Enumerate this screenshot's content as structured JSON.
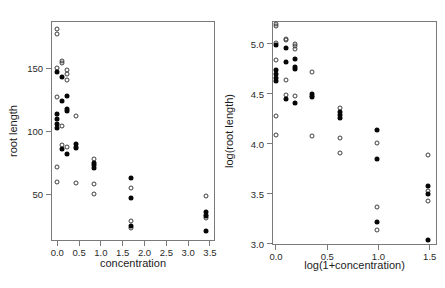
{
  "figure": {
    "background": "#ffffff",
    "axis_color": "#7a7a7a",
    "open_marker_color": "#3d3d3d",
    "filled_marker_color": "#060606"
  },
  "chart_data": [
    {
      "type": "scatter",
      "title": "",
      "xlabel": "concentration",
      "ylabel": "root length",
      "xlim": [
        -0.144,
        3.615
      ],
      "ylim": [
        13.05,
        187.7
      ],
      "xticks": [
        0.0,
        0.5,
        1.0,
        1.5,
        2.0,
        2.5,
        3.0,
        3.5
      ],
      "xtick_labels": [
        "0.0",
        "0.5",
        "1.0",
        "1.5",
        "2.0",
        "2.5",
        "3.0",
        "3.5"
      ],
      "yticks": [
        50,
        100,
        150
      ],
      "ytick_labels": [
        "50",
        "100",
        "150"
      ],
      "grid": false,
      "legend": "none",
      "series": [
        {
          "name": "open-circles",
          "marker": "open",
          "points": [
            [
              0,
              181
            ],
            [
              0,
              177
            ],
            [
              0,
              150
            ],
            [
              0,
              127
            ],
            [
              0,
              72
            ],
            [
              0,
              60
            ],
            [
              0.106,
              156
            ],
            [
              0.106,
              154
            ],
            [
              0.106,
              104
            ],
            [
              0.106,
              89
            ],
            [
              0.213,
              149
            ],
            [
              0.213,
              146
            ],
            [
              0.213,
              141
            ],
            [
              0.213,
              88
            ],
            [
              0.425,
              112
            ],
            [
              0.425,
              88
            ],
            [
              0.425,
              59
            ],
            [
              0.85,
              78
            ],
            [
              0.85,
              58
            ],
            [
              0.85,
              50
            ],
            [
              1.7,
              55
            ],
            [
              1.7,
              29
            ],
            [
              1.7,
              23
            ],
            [
              3.4,
              49
            ],
            [
              3.4,
              34
            ],
            [
              3.4,
              31
            ]
          ]
        },
        {
          "name": "filled-circles",
          "marker": "filled",
          "points": [
            [
              0,
              147
            ],
            [
              0,
              114
            ],
            [
              0,
              110
            ],
            [
              0,
              106
            ],
            [
              0,
              103
            ],
            [
              0.106,
              143
            ],
            [
              0.106,
              124
            ],
            [
              0.106,
              86
            ],
            [
              0.213,
              128
            ],
            [
              0.213,
              118
            ],
            [
              0.213,
              116
            ],
            [
              0.213,
              82
            ],
            [
              0.425,
              90
            ],
            [
              0.425,
              87
            ],
            [
              0.85,
              75
            ],
            [
              0.85,
              73
            ],
            [
              0.85,
              71
            ],
            [
              1.7,
              63
            ],
            [
              1.7,
              47
            ],
            [
              1.7,
              25
            ],
            [
              3.4,
              36
            ],
            [
              3.4,
              33
            ],
            [
              3.4,
              21
            ]
          ]
        }
      ]
    },
    {
      "type": "scatter",
      "title": "",
      "xlabel": "log(1+concentration)",
      "ylabel": "log(root length)",
      "xlim": [
        -0.039,
        1.571
      ],
      "ylim": [
        2.985,
        5.23
      ],
      "xticks": [
        0.0,
        0.5,
        1.0,
        1.5
      ],
      "xtick_labels": [
        "0.0",
        "0.5",
        "1.0",
        "1.5"
      ],
      "yticks": [
        3.0,
        3.5,
        4.0,
        4.5,
        5.0
      ],
      "ytick_labels": [
        "3.0",
        "3.5",
        "4.0",
        "4.5",
        "5.0"
      ],
      "grid": false,
      "legend": "none",
      "series": [
        {
          "name": "open-circles",
          "marker": "open",
          "points": [
            [
              0,
              5.2
            ],
            [
              0,
              5.18
            ],
            [
              0,
              5.01
            ],
            [
              0,
              4.84
            ],
            [
              0,
              4.28
            ],
            [
              0,
              4.09
            ],
            [
              0.1,
              5.05
            ],
            [
              0.1,
              5.04
            ],
            [
              0.1,
              4.64
            ],
            [
              0.1,
              4.49
            ],
            [
              0.19,
              5.0
            ],
            [
              0.19,
              4.98
            ],
            [
              0.19,
              4.95
            ],
            [
              0.19,
              4.48
            ],
            [
              0.35,
              4.72
            ],
            [
              0.35,
              4.48
            ],
            [
              0.35,
              4.08
            ],
            [
              0.62,
              4.36
            ],
            [
              0.62,
              4.06
            ],
            [
              0.62,
              3.91
            ],
            [
              0.99,
              4.01
            ],
            [
              0.99,
              3.37
            ],
            [
              0.99,
              3.14
            ],
            [
              1.48,
              3.89
            ],
            [
              1.48,
              3.53
            ],
            [
              1.48,
              3.43
            ]
          ]
        },
        {
          "name": "filled-circles",
          "marker": "filled",
          "points": [
            [
              0,
              4.99
            ],
            [
              0,
              4.74
            ],
            [
              0,
              4.7
            ],
            [
              0,
              4.66
            ],
            [
              0,
              4.63
            ],
            [
              0.1,
              4.96
            ],
            [
              0.1,
              4.82
            ],
            [
              0.1,
              4.45
            ],
            [
              0.19,
              4.85
            ],
            [
              0.19,
              4.77
            ],
            [
              0.19,
              4.75
            ],
            [
              0.19,
              4.41
            ],
            [
              0.35,
              4.5
            ],
            [
              0.35,
              4.47
            ],
            [
              0.62,
              4.32
            ],
            [
              0.62,
              4.29
            ],
            [
              0.62,
              4.26
            ],
            [
              0.99,
              4.14
            ],
            [
              0.99,
              3.85
            ],
            [
              0.99,
              3.22
            ],
            [
              1.48,
              3.58
            ],
            [
              1.48,
              3.5
            ],
            [
              1.48,
              3.04
            ]
          ]
        }
      ]
    }
  ]
}
